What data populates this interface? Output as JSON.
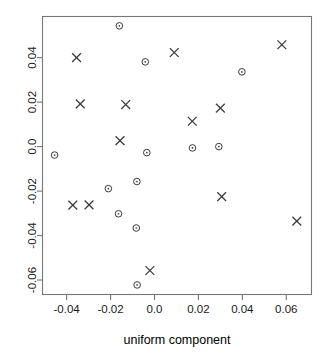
{
  "figure": {
    "title": "",
    "background_color": "#ffffff",
    "frame_color": "#777777",
    "marker_color": "#3a3a3a"
  },
  "axes": {
    "x_title": "uniform component",
    "y_title": "",
    "x_ticks": [
      "-0.04",
      "-0.02",
      "0.0",
      "0.02",
      "0.04",
      "0.06"
    ],
    "y_ticks": [
      "0.04",
      "0.02",
      "0.0",
      "-0.02",
      "-0.04",
      "-0.06"
    ]
  },
  "chart_data": {
    "type": "scatter",
    "title": "",
    "xlabel": "uniform component",
    "ylabel": "",
    "xlim": [
      -0.051,
      0.0715
    ],
    "ylim": [
      -0.0665,
      0.0585
    ],
    "xticks": [
      -0.04,
      -0.02,
      0.0,
      0.02,
      0.04,
      0.06
    ],
    "xticklabels": [
      "-0.04",
      "-0.02",
      "0.0",
      "0.02",
      "0.04",
      "0.06"
    ],
    "yticks": [
      0.04,
      0.02,
      0.0,
      -0.02,
      -0.04,
      -0.06
    ],
    "yticklabels": [
      "0.04",
      "0.02",
      "0.0",
      "-0.02",
      "-0.04",
      "-0.06"
    ],
    "grid": false,
    "legend": false,
    "series": [
      {
        "name": "cross-group",
        "marker": "x",
        "color": "#3a3a3a",
        "points": [
          {
            "x": -0.0355,
            "y": 0.04
          },
          {
            "x": -0.0338,
            "y": 0.0192
          },
          {
            "x": -0.0131,
            "y": 0.0189
          },
          {
            "x": -0.0157,
            "y": 0.0027
          },
          {
            "x": 0.009,
            "y": 0.0423
          },
          {
            "x": 0.0172,
            "y": 0.0114
          },
          {
            "x": 0.03,
            "y": 0.0173
          },
          {
            "x": 0.058,
            "y": 0.0458
          },
          {
            "x": -0.0372,
            "y": -0.0263
          },
          {
            "x": -0.0298,
            "y": -0.0262
          },
          {
            "x": 0.0306,
            "y": -0.0225
          },
          {
            "x": 0.0648,
            "y": -0.0335
          },
          {
            "x": -0.0021,
            "y": -0.0557
          }
        ]
      },
      {
        "name": "circle-group",
        "marker": "o",
        "color": "#3a3a3a",
        "points": [
          {
            "x": -0.016,
            "y": 0.0543
          },
          {
            "x": -0.0042,
            "y": 0.0381
          },
          {
            "x": 0.0398,
            "y": 0.0336
          },
          {
            "x": -0.0455,
            "y": -0.0038
          },
          {
            "x": -0.0035,
            "y": -0.0027
          },
          {
            "x": 0.0173,
            "y": -0.0006
          },
          {
            "x": 0.0293,
            "y": 0.0
          },
          {
            "x": -0.021,
            "y": -0.0189
          },
          {
            "x": -0.008,
            "y": -0.0157
          },
          {
            "x": -0.0164,
            "y": -0.0302
          },
          {
            "x": -0.0083,
            "y": -0.0366
          },
          {
            "x": -0.0079,
            "y": -0.0622
          }
        ]
      }
    ]
  }
}
